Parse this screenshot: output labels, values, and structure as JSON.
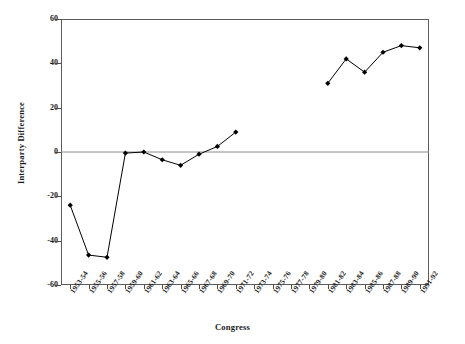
{
  "chart_data": {
    "type": "line",
    "title": "",
    "xlabel": "Congress",
    "ylabel": "Interparty Difference",
    "ylim": [
      -60,
      60
    ],
    "yticks": [
      60,
      40,
      20,
      0,
      -20,
      -40,
      -60
    ],
    "ytick_labels": [
      "60",
      "40",
      "20",
      "0",
      "-20",
      "-40",
      "-60"
    ],
    "grid": false,
    "legend": null,
    "zero_line": true,
    "marker": "filled-diamond",
    "line_color": "#000000",
    "categories": [
      "1953-54",
      "1955-56",
      "1957-58",
      "1959-60",
      "1961-62",
      "1963-64",
      "1965-66",
      "1967-68",
      "1969-70",
      "1971-72",
      "1973-74",
      "1975-76",
      "1977-78",
      "1979-80",
      "1981-82",
      "1983-84",
      "1985-86",
      "1987-88",
      "1989-90",
      "1991-92"
    ],
    "values": [
      -24,
      -46.5,
      -47.5,
      -0.5,
      0,
      -3.5,
      -6,
      -1,
      2.5,
      9,
      null,
      null,
      null,
      null,
      31,
      42,
      36,
      45,
      48,
      47
    ],
    "series": [
      {
        "name": "Interparty Difference",
        "values": [
          -24,
          -46.5,
          -47.5,
          -0.5,
          0,
          -3.5,
          -6,
          -1,
          2.5,
          9,
          null,
          null,
          null,
          null,
          31,
          42,
          36,
          45,
          48,
          47
        ]
      }
    ]
  }
}
